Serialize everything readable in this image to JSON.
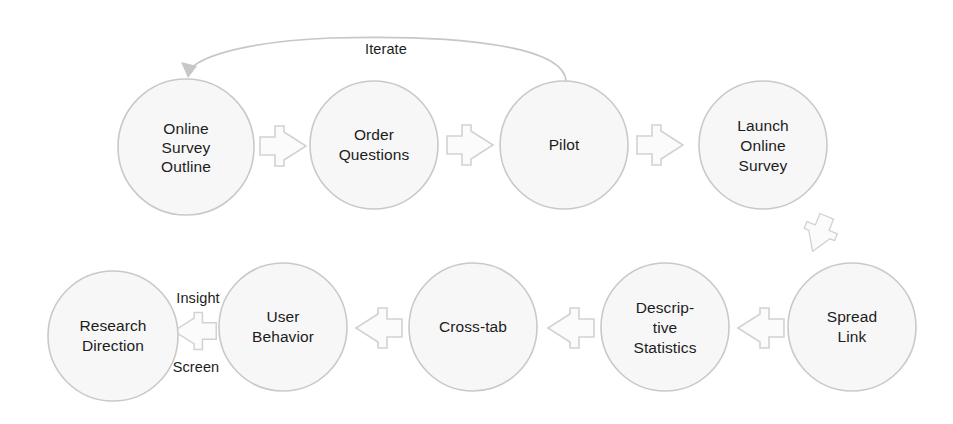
{
  "diagram": {
    "type": "process-flow",
    "canvas": {
      "width": 953,
      "height": 424
    },
    "colors": {
      "node_fill": "#f7f7f7",
      "node_stroke": "#c9c9c9",
      "arrow_fill": "#fbfbfb",
      "arrow_stroke": "#d2d2d2",
      "curve_stroke": "#c7c7c7",
      "text": "#1c1c1c",
      "background": "#ffffff"
    },
    "nodes": [
      {
        "id": "online-survey-outline",
        "lines": [
          "Online",
          "Survey",
          "Outline"
        ],
        "cx": 186,
        "cy": 147,
        "r": 68,
        "row": "top",
        "order": 1
      },
      {
        "id": "order-questions",
        "lines": [
          "Order",
          "Questions"
        ],
        "cx": 374,
        "cy": 145,
        "r": 64,
        "row": "top",
        "order": 2
      },
      {
        "id": "pilot",
        "lines": [
          "Pilot"
        ],
        "cx": 564,
        "cy": 145,
        "r": 64,
        "row": "top",
        "order": 3
      },
      {
        "id": "launch-online-survey",
        "lines": [
          "Launch",
          "Online",
          "Survey"
        ],
        "cx": 763,
        "cy": 145,
        "r": 64,
        "row": "top",
        "order": 4
      },
      {
        "id": "spread-link",
        "lines": [
          "Spread",
          "Link"
        ],
        "cx": 852,
        "cy": 327,
        "r": 64,
        "row": "bottom",
        "order": 5
      },
      {
        "id": "descriptive-statistics",
        "lines": [
          "Descrip-",
          "tive",
          "Statistics"
        ],
        "cx": 665,
        "cy": 327,
        "r": 64,
        "row": "bottom",
        "order": 6
      },
      {
        "id": "cross-tab",
        "lines": [
          "Cross-tab"
        ],
        "cx": 473,
        "cy": 327,
        "r": 64,
        "row": "bottom",
        "order": 7
      },
      {
        "id": "user-behavior",
        "lines": [
          "User",
          "Behavior"
        ],
        "cx": 283,
        "cy": 327,
        "r": 64,
        "row": "bottom",
        "order": 8
      },
      {
        "id": "research-direction",
        "lines": [
          "Research",
          "Direction"
        ],
        "cx": 113,
        "cy": 336,
        "r": 65,
        "row": "bottom",
        "order": 9
      }
    ],
    "arrows": [
      {
        "id": "outline-to-order",
        "from": "online-survey-outline",
        "to": "order-questions",
        "cx": 282,
        "cy": 146,
        "rotation": 0
      },
      {
        "id": "order-to-pilot",
        "from": "order-questions",
        "to": "pilot",
        "cx": 469,
        "cy": 145,
        "rotation": 0
      },
      {
        "id": "pilot-to-launch",
        "from": "pilot",
        "to": "launch-online-survey",
        "cx": 659,
        "cy": 145,
        "rotation": 0
      },
      {
        "id": "launch-to-spread",
        "from": "launch-online-survey",
        "to": "spread-link",
        "cx": 820,
        "cy": 233,
        "rotation": 112
      },
      {
        "id": "spread-to-descriptive",
        "from": "spread-link",
        "to": "descriptive-statistics",
        "cx": 762,
        "cy": 328,
        "rotation": 180
      },
      {
        "id": "descriptive-to-crosstab",
        "from": "descriptive-statistics",
        "to": "cross-tab",
        "cx": 572,
        "cy": 328,
        "rotation": 180
      },
      {
        "id": "crosstab-to-behavior",
        "from": "cross-tab",
        "to": "user-behavior",
        "cx": 380,
        "cy": 328,
        "rotation": 180
      },
      {
        "id": "behavior-to-research",
        "from": "user-behavior",
        "to": "research-direction",
        "cx": 196,
        "cy": 331,
        "rotation": 180
      }
    ],
    "edge_labels": [
      {
        "id": "iterate-label",
        "text": "Iterate",
        "x": 386,
        "y": 50
      },
      {
        "id": "insight-label",
        "text": "Insight",
        "x": 198,
        "y": 299
      },
      {
        "id": "screen-label",
        "text": "Screen",
        "x": 196,
        "y": 368
      }
    ],
    "feedback_edge": {
      "id": "iterate-edge",
      "label": "Iterate",
      "from": "pilot",
      "to": "online-survey-outline",
      "path": "M 566 82 C 566 48, 470 34, 330 38 C 258 41, 206 53, 190 69"
    }
  }
}
